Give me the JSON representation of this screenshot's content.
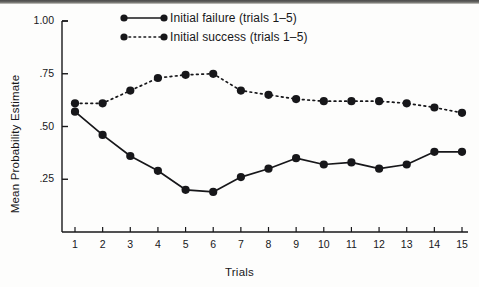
{
  "figure": {
    "background_color": "#fdfdfc",
    "ink_color": "#17171a"
  },
  "legend": {
    "position": "top-center",
    "entries": [
      {
        "label": "Initial failure (trials 1–5)",
        "key": "solid-line-filled-circle",
        "line_style": "solid"
      },
      {
        "label": "Initial success (trials 1–5)",
        "key": "dotted-line-filled-circle",
        "line_style": "dotted"
      }
    ]
  },
  "axes": {
    "y_title": "Mean Probability Estimate",
    "x_title": "Trials",
    "y_ticks": [
      "1.00",
      ".75",
      ".50",
      ".25"
    ],
    "x_ticks": [
      "1",
      "2",
      "3",
      "4",
      "5",
      "6",
      "7",
      "8",
      "9",
      "10",
      "11",
      "12",
      "13",
      "14",
      "15"
    ]
  },
  "chart_data": {
    "type": "line",
    "title": "",
    "subtitle": "",
    "xlabel": "Trials",
    "ylabel": "Mean Probability Estimate",
    "x": [
      1,
      2,
      3,
      4,
      5,
      6,
      7,
      8,
      9,
      10,
      11,
      12,
      13,
      14,
      15
    ],
    "xlim": [
      0.5,
      15.5
    ],
    "ylim": [
      0.0,
      1.0
    ],
    "ytick_values": [
      1.0,
      0.75,
      0.5,
      0.25
    ],
    "ytick_labels": [
      "1.00",
      ".75",
      ".50",
      ".25"
    ],
    "grid": false,
    "legend_position": "top-center",
    "series": [
      {
        "name": "Initial failure (trials 1–5)",
        "line_style": "solid",
        "marker": "filled-circle",
        "color": "#17171a",
        "values": [
          0.57,
          0.46,
          0.36,
          0.29,
          0.2,
          0.19,
          0.26,
          0.3,
          0.35,
          0.32,
          0.33,
          0.3,
          0.32,
          0.38,
          0.38
        ]
      },
      {
        "name": "Initial success (trials 1–5)",
        "line_style": "dotted",
        "marker": "filled-circle",
        "color": "#17171a",
        "values": [
          0.61,
          0.61,
          0.67,
          0.73,
          0.745,
          0.75,
          0.67,
          0.65,
          0.63,
          0.62,
          0.62,
          0.62,
          0.61,
          0.59,
          0.565
        ]
      }
    ]
  }
}
